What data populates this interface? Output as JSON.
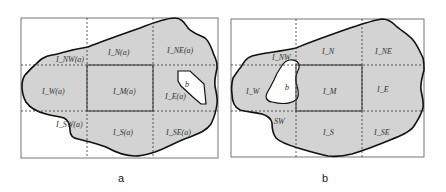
{
  "colors": {
    "region_fill": "#d3d3d3",
    "region_stroke": "#111111",
    "frame_stroke": "#666666",
    "grid_dash": "#333333",
    "hole_fill": "#ffffff"
  },
  "panel_a": {
    "caption": "a",
    "hole_label": "b",
    "tiles": {
      "NW": "I_NW(a)",
      "N": "I_N(a)",
      "NE": "I_NE(a)",
      "W": "I_W(a)",
      "M": "I_M(a)",
      "E": "I_E(a)",
      "SW": "I_SW(a)",
      "S": "I_S(a)",
      "SE": "I_SE(a)"
    }
  },
  "panel_b": {
    "caption": "b",
    "hole_label": "b",
    "tiles": {
      "NW": "I_NW",
      "N": "I_N",
      "NE": "I_NE",
      "W": "I_W",
      "M": "I_M",
      "E": "I_E",
      "SW": "SW",
      "S": "I_S",
      "SE": "I_SE"
    }
  }
}
